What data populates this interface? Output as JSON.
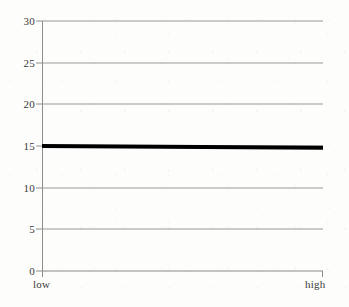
{
  "chart_data": {
    "type": "line",
    "title": "",
    "subtitle": "",
    "xlabel": "",
    "ylabel": "",
    "x": [
      "low",
      "high"
    ],
    "xtick_labels": [
      "low",
      "high"
    ],
    "categories": [
      "low",
      "high"
    ],
    "series": [
      {
        "name": "",
        "values": [
          15.0,
          14.8
        ],
        "color": "#000000",
        "line_width_px": 4,
        "style": "solid"
      }
    ],
    "values": [
      15.0,
      14.8
    ],
    "ylim": [
      0,
      30
    ],
    "yticks": [
      0,
      5,
      10,
      15,
      20,
      25,
      30
    ],
    "ytick_labels": [
      "0",
      "5",
      "10",
      "15",
      "20",
      "25",
      "30"
    ],
    "grid": true,
    "grid_axis": "y",
    "grid_color": "#9a9a96",
    "legend": false,
    "legend_position": "none",
    "annotations": [],
    "background_color": "#fdfdfc",
    "axis_color": "#8d8d89",
    "text_color": "#3a3a38"
  },
  "axes": {
    "y": {
      "ticks": [
        {
          "value": 30,
          "label": "30"
        },
        {
          "value": 25,
          "label": "25"
        },
        {
          "value": 20,
          "label": "20"
        },
        {
          "value": 15,
          "label": "15"
        },
        {
          "value": 10,
          "label": "10"
        },
        {
          "value": 5,
          "label": "5"
        },
        {
          "value": 0,
          "label": "0"
        }
      ]
    },
    "x": {
      "ticks": [
        {
          "position": 0,
          "label": "low"
        },
        {
          "position": 1,
          "label": "high"
        }
      ]
    }
  }
}
